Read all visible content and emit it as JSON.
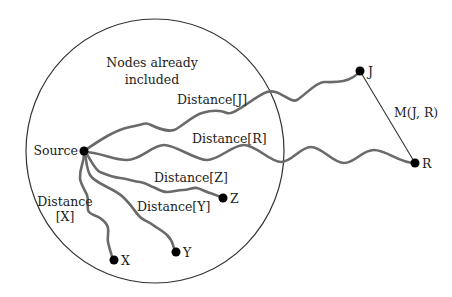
{
  "diagram": {
    "region_label_line1": "Nodes already",
    "region_label_line2": "included",
    "nodes": {
      "source": "Source",
      "x": "X",
      "y": "Y",
      "z": "Z",
      "j": "J",
      "r": "R"
    },
    "edges": {
      "distance_j": "Distance[J]",
      "distance_r": "Distance[R]",
      "distance_z": "Distance[Z]",
      "distance_y": "Distance[Y]",
      "distance_x_line1": "Distance",
      "distance_x_line2": "[X]",
      "m_jr": "M(J, R)"
    },
    "colors": {
      "path": "#6a6a6a",
      "node": "#000000",
      "boundary": "#333333"
    }
  }
}
